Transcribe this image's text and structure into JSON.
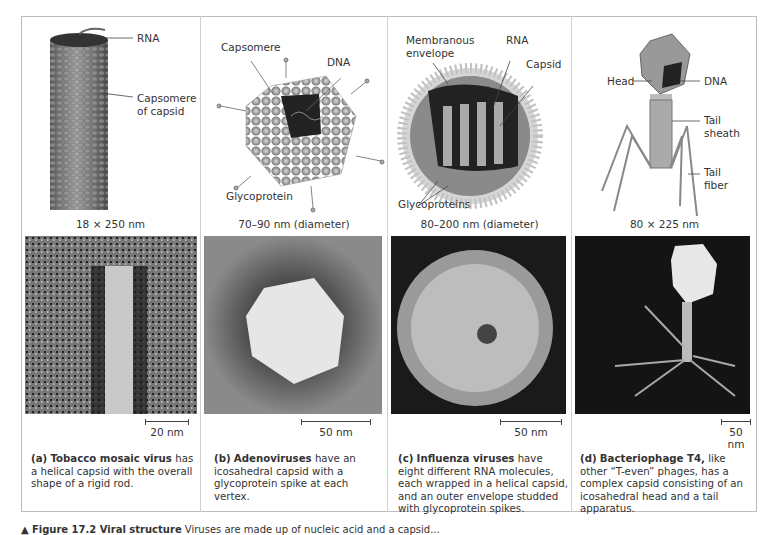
{
  "figure": {
    "caption_label": "Figure 17.2 Viral structure",
    "caption_text": "Viruses are made up of nucleic acid and a capsid..."
  },
  "panels": [
    {
      "id": "a",
      "labels": [
        "RNA",
        "Capsomere",
        "of capsid"
      ],
      "dimensions": "18 × 250 nm",
      "scale_bar": "20 nm",
      "caption_letter": "(a)",
      "caption_name": "Tobacco mosaic virus",
      "caption_rest": " has a helical capsid with the overall shape of a rigid rod."
    },
    {
      "id": "b",
      "labels": [
        "Capsomere",
        "DNA",
        "Glycoprotein"
      ],
      "dimensions": "70–90 nm (diameter)",
      "scale_bar": "50 nm",
      "caption_letter": "(b)",
      "caption_name": "Adenoviruses",
      "caption_rest": " have an icosahedral capsid with a glycoprotein spike at each vertex."
    },
    {
      "id": "c",
      "labels": [
        "Membranous",
        "envelope",
        "RNA",
        "Capsid",
        "Glycoproteins"
      ],
      "dimensions": "80–200 nm (diameter)",
      "scale_bar": "50 nm",
      "caption_letter": "(c)",
      "caption_name": "Influenza viruses",
      "caption_rest": " have eight different RNA molecules, each wrapped in a helical capsid, and an outer envelope studded with glycoprotein spikes."
    },
    {
      "id": "d",
      "labels": [
        "Head",
        "DNA",
        "Tail",
        "sheath",
        "Tail",
        "fiber"
      ],
      "dimensions": "80 × 225 nm",
      "scale_bar": "50 nm",
      "caption_letter": "(d)",
      "caption_name": "Bacteriophage T4,",
      "caption_rest": " like other “T-even” phages, has a complex capsid consisting of an icosahedral head and a tail apparatus."
    }
  ],
  "colors": {
    "frame": "#bdbdbd",
    "text": "#333333",
    "micrograph_dark": "#1a1a1a"
  }
}
